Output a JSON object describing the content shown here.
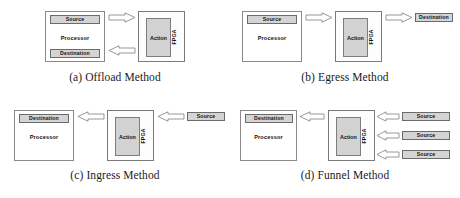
{
  "figure": {
    "panels": [
      {
        "id": "offload",
        "caption": "(a) Offload Method",
        "processor_label": "Processor",
        "fpga_label": "FPGA",
        "action_label": "Action",
        "source_label": "Source",
        "destination_label": "Destination",
        "arrows": [
          {
            "name": "processor-to-fpga",
            "direction": "right"
          },
          {
            "name": "fpga-to-processor",
            "direction": "left"
          }
        ]
      },
      {
        "id": "egress",
        "caption": "(b) Egress Method",
        "processor_label": "Processor",
        "fpga_label": "FPGA",
        "action_label": "Action",
        "source_label": "Source",
        "destination_label": "Destination",
        "arrows": [
          {
            "name": "processor-to-fpga",
            "direction": "right"
          },
          {
            "name": "fpga-to-destination",
            "direction": "right"
          }
        ]
      },
      {
        "id": "ingress",
        "caption": "(c) Ingress Method",
        "processor_label": "Processor",
        "fpga_label": "FPGA",
        "action_label": "Action",
        "source_label": "Source",
        "destination_label": "Destination",
        "arrows": [
          {
            "name": "fpga-to-processor",
            "direction": "left"
          },
          {
            "name": "source-to-fpga",
            "direction": "left"
          }
        ]
      },
      {
        "id": "funnel",
        "caption": "(d) Funnel Method",
        "processor_label": "Processor",
        "fpga_label": "FPGA",
        "action_label": "Action",
        "destination_label": "Destination",
        "source_labels": [
          "Source",
          "Source",
          "Source"
        ],
        "arrows": [
          {
            "name": "fpga-to-processor",
            "direction": "left"
          },
          {
            "name": "source-1-to-fpga",
            "direction": "left"
          },
          {
            "name": "source-2-to-fpga",
            "direction": "left"
          },
          {
            "name": "source-3-to-fpga",
            "direction": "left"
          }
        ]
      }
    ],
    "colors": {
      "shaded_fill": "#d4d4d4",
      "action_fill": "#d2d2d2",
      "box_stroke": "#6e6e6e",
      "arrow_stroke": "#8c8c8c",
      "background": "#ffffff",
      "text": "#111111"
    }
  }
}
